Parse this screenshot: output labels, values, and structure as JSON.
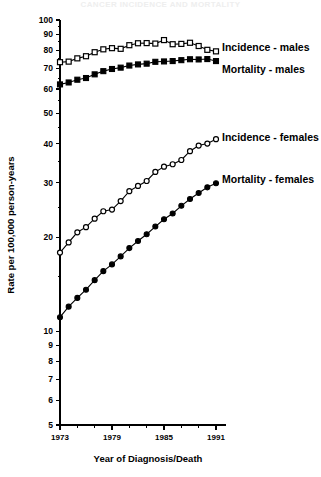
{
  "figure": {
    "faint_header": "CANCER INCIDENCE AND MORTALITY",
    "y_axis_title": "Rate per 100,000 person-years",
    "x_axis_title": "Year of Diagnosis/Death"
  },
  "labels": {
    "incidence_males": "Incidence - males",
    "mortality_males": "Mortality - males",
    "incidence_females": "Incidence - females",
    "mortality_females": "Mortality - females"
  },
  "chart_data": {
    "type": "line",
    "title": "",
    "subtitle": "",
    "xlabel": "Year of Diagnosis/Death",
    "ylabel": "Rate per 100,000 person-years",
    "yscale": "log",
    "ylim": [
      5,
      100
    ],
    "xlim": [
      1973,
      1991
    ],
    "grid": false,
    "legend_position": "inline-right",
    "y_ticks": [
      5,
      6,
      7,
      8,
      9,
      10,
      20,
      30,
      40,
      50,
      60,
      70,
      80,
      90,
      100
    ],
    "y_tick_labels": [
      "5",
      "6",
      "7",
      "8",
      "9",
      "10",
      "20",
      "30",
      "40",
      "50",
      "60",
      "70",
      "80",
      "90",
      "100"
    ],
    "x_ticks_major": [
      1973,
      1979,
      1985,
      1991
    ],
    "x_tick_labels": [
      "1973",
      "1979",
      "1985",
      "1991"
    ],
    "x_ticks_minor": [
      1975,
      1977,
      1981,
      1983,
      1987,
      1989
    ],
    "x": [
      1973,
      1974,
      1975,
      1976,
      1977,
      1978,
      1979,
      1980,
      1981,
      1982,
      1983,
      1984,
      1985,
      1986,
      1987,
      1988,
      1989,
      1990,
      1991
    ],
    "series": [
      {
        "name": "Incidence - males",
        "marker": "open-square",
        "values": [
          73.2,
          73.5,
          75.3,
          76.5,
          78.8,
          80.5,
          81.2,
          80.8,
          83.0,
          84.2,
          84.3,
          84.0,
          86.2,
          83.6,
          83.8,
          84.5,
          82.5,
          80.2,
          79.3
        ]
      },
      {
        "name": "Mortality - males",
        "marker": "filled-square",
        "values": [
          62.1,
          63.0,
          64.3,
          65.1,
          66.9,
          68.5,
          69.6,
          70.3,
          71.4,
          72.0,
          72.4,
          73.4,
          73.6,
          73.8,
          74.3,
          74.8,
          74.7,
          74.9,
          73.8
        ]
      },
      {
        "name": "Incidence - females",
        "marker": "open-circle",
        "values": [
          17.9,
          19.3,
          20.8,
          21.6,
          23.0,
          24.3,
          24.6,
          26.2,
          28.2,
          29.3,
          30.4,
          32.5,
          33.8,
          34.4,
          35.5,
          37.9,
          39.5,
          40.1,
          41.4
        ]
      },
      {
        "name": "Mortality - females",
        "marker": "filled-circle",
        "values": [
          11.1,
          12.0,
          12.8,
          13.6,
          14.6,
          15.6,
          16.4,
          17.4,
          18.5,
          19.5,
          20.5,
          21.7,
          22.9,
          23.9,
          25.3,
          26.6,
          27.8,
          29.0,
          29.9
        ]
      }
    ]
  }
}
